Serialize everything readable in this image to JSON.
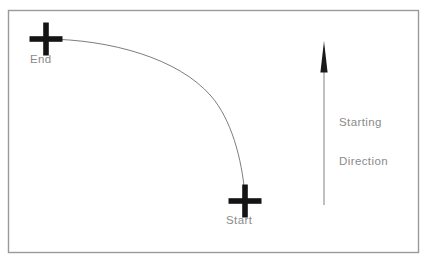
{
  "diagram": {
    "background_color": "#ffffff",
    "border": {
      "name": "diagram-border",
      "color": "#9a9a9a",
      "x": 8.5,
      "y": 10.5,
      "width": 410,
      "height": 242,
      "stroke_width": 1.4
    },
    "markers": [
      {
        "id": "end",
        "label": "End",
        "shape": "cross",
        "color": "#141414",
        "cx": 46,
        "cy": 39,
        "arm_length": 17,
        "arm_thickness": 5.5,
        "label_x": 30,
        "label_y": 53
      },
      {
        "id": "start",
        "label": "Start",
        "shape": "cross",
        "color": "#141414",
        "cx": 245,
        "cy": 201,
        "arm_length": 17,
        "arm_thickness": 5.5,
        "label_x": 226,
        "label_y": 214
      }
    ],
    "path": {
      "name": "trajectory-curve",
      "description": "Curved path from Start to End",
      "color": "#6e6e6e",
      "stroke_width": 0.9,
      "type": "quarter-ellipse-arc",
      "from": {
        "x": 46,
        "y": 39
      },
      "to": {
        "x": 245,
        "y": 195
      },
      "control_points": [
        {
          "x": 150,
          "y": 41
        },
        {
          "x": 245,
          "y": 110
        }
      ],
      "tangent_at_end": "horizontal",
      "tangent_at_start": "vertical"
    },
    "arrow": {
      "name": "starting-direction-arrow",
      "color": "#1a1a1a",
      "shaft_color": "#8c8c8c",
      "x": 324,
      "tip_y": 41,
      "head_base_y": 72,
      "tail_y": 205,
      "head_half_width": 3.6,
      "shaft_width": 1.1,
      "direction": "up",
      "label_lines": [
        "Starting",
        "Direction"
      ],
      "label_x": 339,
      "label_y": 90
    },
    "text_color": "#8a8a8a"
  }
}
